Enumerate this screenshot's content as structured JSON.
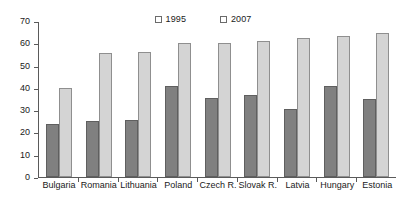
{
  "chart_data": {
    "type": "bar",
    "title": "",
    "subtitle": "",
    "xlabel": "",
    "ylabel": "",
    "ylim": [
      0,
      70
    ],
    "ytick_step": 10,
    "yticks": [
      0,
      10,
      20,
      30,
      40,
      50,
      60,
      70
    ],
    "grid": false,
    "legend_position": "top-center",
    "categories": [
      "Bulgaria",
      "Romania",
      "Lithuania",
      "Poland",
      "Czech R.",
      "Slovak R.",
      "Latvia",
      "Hungary",
      "Estonia"
    ],
    "series": [
      {
        "name": "1995",
        "color": "#808080",
        "values": [
          24,
          25,
          25.5,
          41,
          35.5,
          37,
          30.5,
          41,
          35
        ]
      },
      {
        "name": "2007",
        "color": "#d4d4d4",
        "values": [
          40,
          55.5,
          56,
          60,
          60,
          61,
          62.5,
          63.5,
          64.5
        ]
      }
    ]
  },
  "legend": {
    "entries": [
      {
        "label": "1995",
        "swatch": "legend-swatch-1995"
      },
      {
        "label": "2007",
        "swatch": "legend-swatch-2007"
      }
    ]
  },
  "colors": {
    "series_1995": "#808080",
    "series_2007": "#d4d4d4",
    "axis": "#5a5a5a",
    "text": "#1a1a1a",
    "background": "#ffffff"
  }
}
